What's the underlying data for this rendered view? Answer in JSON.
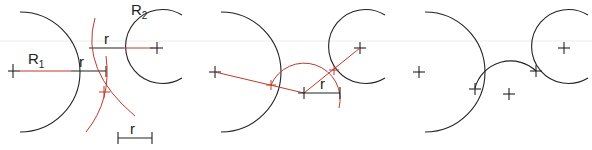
{
  "colors": {
    "construction": "#c0392b",
    "geometry": "#222222",
    "background": "#ffffff"
  },
  "panels": [
    {
      "step": 1,
      "labels": {
        "r1": "R",
        "r1_sub": "1",
        "r2": "R",
        "r2_sub": "2",
        "offset_r1": "r",
        "offset_r2": "r",
        "scale_r": "r"
      },
      "description": "Offset each circle radius by r and draw arcs R1+r and R2+r; their intersection is the arc center"
    },
    {
      "step": 2,
      "labels": {
        "radius": "r"
      },
      "description": "Join the intersection to each center to find tangent points; draw arc of radius r"
    },
    {
      "step": 3,
      "labels": {},
      "description": "Finished tangent arc connecting the two circles"
    }
  ]
}
